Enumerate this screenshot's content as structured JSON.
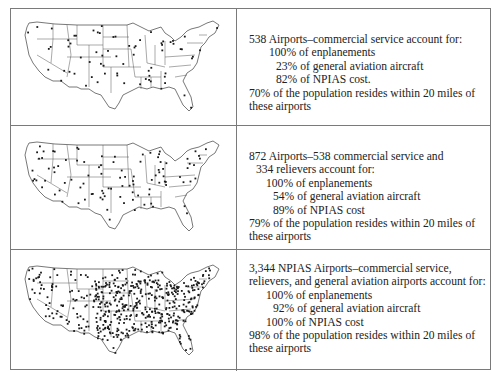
{
  "figure": {
    "rows": [
      {
        "map_label": "commercial-service-airports-map",
        "dot_density": "sparse",
        "dot_count_approx": 220,
        "headline_lines": [
          "538 Airports–commercial service account for:"
        ],
        "stats": [
          {
            "value": "100%",
            "label": "of enplanements"
          },
          {
            "value": "23%",
            "label": "of general aviation aircraft"
          },
          {
            "value": "82%",
            "label": "of NPIAS cost."
          }
        ],
        "population_lines": [
          "70% of the population resides within 20 miles of",
          "these airports"
        ]
      },
      {
        "map_label": "commercial-and-reliever-airports-map",
        "dot_density": "medium",
        "dot_count_approx": 300,
        "headline_lines": [
          "872 Airports–538 commercial service and",
          "334 relievers account for:"
        ],
        "stats": [
          {
            "value": "100%",
            "label": "of enplanements"
          },
          {
            "value": "54%",
            "label": "of general aviation aircraft"
          },
          {
            "value": "89%",
            "label": "of NPIAS cost"
          }
        ],
        "population_lines": [
          "79% of the population resides within 20 miles of",
          "these airports"
        ]
      },
      {
        "map_label": "all-npias-airports-map",
        "dot_density": "dense",
        "dot_count_approx": 1400,
        "headline_lines": [
          "3,344 NPIAS Airports–commercial service,",
          "relievers, and general aviation airports account for:"
        ],
        "stats": [
          {
            "value": "100%",
            "label": "of enplanements"
          },
          {
            "value": "92%",
            "label": "of general aviation aircraft"
          },
          {
            "value": "100%",
            "label": "of NPIAS cost"
          }
        ],
        "population_lines": [
          "98% of the population resides within 20 miles of",
          "these airports"
        ]
      }
    ],
    "colors": {
      "border": "#7a7a7a",
      "map_outline": "#555555",
      "dot": "#1a1a1a",
      "text": "#222222"
    }
  }
}
